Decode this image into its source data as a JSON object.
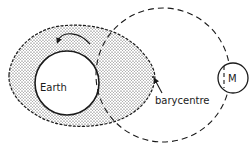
{
  "diagram": {
    "labels": {
      "earth": "Earth",
      "barycentre": "barycentre",
      "moon": "M"
    },
    "colors": {
      "ink": "#1a1a1a",
      "background": "#ffffff",
      "stipple": "#333333"
    },
    "elements": {
      "earth_circle": {
        "cx": 67,
        "cy": 83,
        "r": 32
      },
      "orbit_circle": {
        "cx": 163,
        "cy": 75,
        "r": 67,
        "style": "dashed"
      },
      "moon_circle": {
        "cx": 233,
        "cy": 78,
        "r": 15
      },
      "tidal_bulge": {
        "style": "stippled",
        "outline": "dashed"
      },
      "rotation_arrow": {
        "direction": "counter-clockwise"
      },
      "barycentre_pointer": {
        "from": [
          163,
          93
        ],
        "to": [
          153,
          77
        ]
      }
    }
  }
}
